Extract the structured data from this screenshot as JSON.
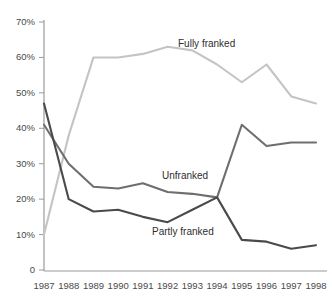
{
  "chart_data": {
    "type": "line",
    "title": "",
    "subtitle": "",
    "xlabel": "",
    "ylabel": "",
    "categories": [
      "1987",
      "1988",
      "1989",
      "1990",
      "1991",
      "1992",
      "1993",
      "1994",
      "1995",
      "1996",
      "1997",
      "1998"
    ],
    "x": [
      1987,
      1988,
      1989,
      1990,
      1991,
      1992,
      1993,
      1994,
      1995,
      1996,
      1997,
      1998
    ],
    "xlim": [
      1987,
      1998
    ],
    "ylim": [
      0,
      70
    ],
    "y_ticks": [
      0,
      10,
      20,
      30,
      40,
      50,
      60,
      70
    ],
    "y_tick_labels": [
      "0",
      "10%",
      "20%",
      "30%",
      "40%",
      "50%",
      "60%",
      "70%"
    ],
    "x_tick_labels": [
      "1987",
      "1988",
      "1989",
      "1990",
      "1991",
      "1992",
      "1993",
      "1994",
      "1995",
      "1996",
      "1997",
      "1998"
    ],
    "grid": false,
    "legend_position": "inline-annotations",
    "series": [
      {
        "name": "Fully franked",
        "color": "#c4c4c4",
        "label_text": "Fully franked",
        "values": [
          10,
          38,
          60,
          60,
          61,
          63,
          62,
          58,
          53,
          58,
          49,
          47
        ]
      },
      {
        "name": "Unfranked",
        "color": "#6e6e6e",
        "label_text": "Unfranked",
        "values": [
          41,
          30,
          23.5,
          23,
          24.5,
          22,
          21.5,
          20.5,
          41,
          35,
          36,
          36
        ]
      },
      {
        "name": "Partly franked",
        "color": "#4a4a4a",
        "label_text": "Partly franked",
        "values": [
          47,
          20,
          16.5,
          17,
          15,
          13.5,
          17,
          20.5,
          8.5,
          8,
          6,
          7
        ]
      }
    ],
    "annotations": [
      {
        "text": "Fully franked",
        "x": 178,
        "y": 38
      },
      {
        "text": "Unfranked",
        "x": 162,
        "y": 170
      },
      {
        "text": "Partly franked",
        "x": 152,
        "y": 226
      }
    ],
    "axis_color": "#9a9a9a"
  },
  "axes": {
    "y_labels": [
      "70%",
      "60%",
      "50%",
      "40%",
      "30%",
      "20%",
      "10%",
      "0"
    ],
    "x_labels": [
      "1987",
      "1988",
      "1989",
      "1990",
      "1991",
      "1992",
      "1993",
      "1994",
      "1995",
      "1996",
      "1997",
      "1998"
    ]
  },
  "series_labels": {
    "fully": "Fully franked",
    "unfranked": "Unfranked",
    "partly": "Partly franked"
  }
}
